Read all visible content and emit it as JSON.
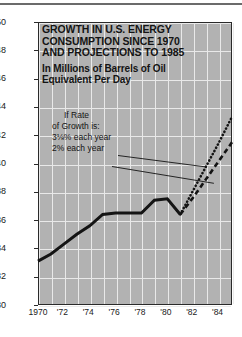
{
  "title": {
    "main": "GROWTH IN U.S. ENERGY CONSUMPTION SINCE 1970 AND PROJECTIONS TO 1985",
    "line1": "GROWTH IN U.S. ENERGY",
    "line2": "CONSUMPTION SINCE 1970",
    "line3": "AND PROJECTIONS TO 1985",
    "subtitle_line1": "In Millions of Barrels of Oil",
    "subtitle_line2": "Equivalent Per Day"
  },
  "annotation": {
    "line1": "If Rate",
    "line2": "of Growth is:",
    "label_high": "3⅛% each year",
    "label_low": "2% each year"
  },
  "colors": {
    "panel": "#b2b2b2",
    "grid": "#e9e9e9",
    "line": "#141414",
    "border": "#2a2a2a",
    "page": "#ffffff"
  },
  "chart_data": {
    "type": "line",
    "title": "GROWTH IN U.S. ENERGY CONSUMPTION SINCE 1970 AND PROJECTIONS TO 1985",
    "subtitle": "In Millions of Barrels of Oil Equivalent Per Day",
    "xlabel": "",
    "ylabel": "Millions of Barrels of Oil Equivalent Per Day",
    "xlim": [
      1970,
      1985
    ],
    "ylim": [
      30,
      50
    ],
    "ytick_step": 2,
    "yticks": [
      30,
      32,
      34,
      36,
      38,
      40,
      42,
      44,
      46,
      48,
      50
    ],
    "ytick_labels": [
      "30",
      "32",
      "34",
      "36",
      "38",
      "40",
      "42",
      "44",
      "46",
      "48",
      "50"
    ],
    "xticks": [
      1970,
      1972,
      1974,
      1976,
      1978,
      1980,
      1982,
      1984
    ],
    "xtick_labels": [
      "1970",
      "'72",
      "'74",
      "'76",
      "'78",
      "'80",
      "'82",
      "'84"
    ],
    "grid": true,
    "grid_x_every": 1,
    "legend": "none",
    "series": [
      {
        "name": "Actual consumption",
        "style": "solid",
        "x": [
          1970,
          1971,
          1972,
          1973,
          1974,
          1975,
          1976,
          1977,
          1978,
          1979,
          1980,
          1981
        ],
        "values": [
          33.1,
          33.6,
          34.3,
          35.0,
          35.6,
          36.4,
          36.5,
          36.5,
          36.5,
          37.4,
          37.5,
          36.4
        ]
      },
      {
        "name": "3⅛% each year",
        "style": "dotted",
        "x": [
          1981,
          1982,
          1983,
          1984,
          1985
        ],
        "values": [
          36.4,
          38.1,
          39.8,
          41.5,
          43.3
        ]
      },
      {
        "name": "2% each year",
        "style": "dashed",
        "x": [
          1981,
          1982,
          1983,
          1984,
          1985
        ],
        "values": [
          36.4,
          37.6,
          38.9,
          40.2,
          41.5
        ]
      }
    ],
    "annotations": [
      {
        "text": "If Rate",
        "kind": "note"
      },
      {
        "text": "of Growth is:",
        "kind": "note"
      },
      {
        "text": "3⅛% each year",
        "kind": "leader-label",
        "points_to": "3⅛% each year"
      },
      {
        "text": "2% each year",
        "kind": "leader-label",
        "points_to": "2% each year"
      }
    ]
  }
}
